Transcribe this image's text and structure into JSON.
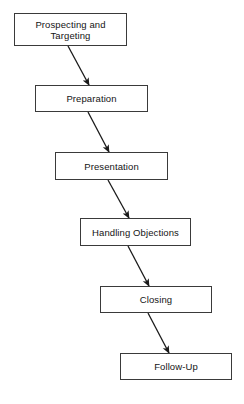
{
  "diagram": {
    "type": "flowchart",
    "orientation": "cascading-vertical",
    "background_color": "#ffffff",
    "box_border_color": "#3a3a3a",
    "arrow_color": "#1a1a1a",
    "text_color": "#141414",
    "nodes": [
      {
        "id": "prospecting-and-targeting",
        "label": "Prospecting and\nTargeting",
        "x": 14,
        "y": 13,
        "width": 113,
        "height": 33
      },
      {
        "id": "preparation",
        "label": "Preparation",
        "x": 35,
        "y": 85,
        "width": 113,
        "height": 27
      },
      {
        "id": "presentation",
        "label": "Presentation",
        "x": 55,
        "y": 152,
        "width": 113,
        "height": 28
      },
      {
        "id": "handling-objections",
        "label": "Handling Objections",
        "x": 80,
        "y": 218,
        "width": 111,
        "height": 28
      },
      {
        "id": "closing",
        "label": "Closing",
        "x": 100,
        "y": 286,
        "width": 112,
        "height": 27
      },
      {
        "id": "follow-up",
        "label": "Follow-Up",
        "x": 120,
        "y": 353,
        "width": 112,
        "height": 27
      }
    ],
    "edges": [
      {
        "id": "edge-1",
        "from": "prospecting-and-targeting",
        "to": "preparation",
        "x1": 68,
        "y1": 46,
        "x2": 89,
        "y2": 85
      },
      {
        "id": "edge-2",
        "from": "preparation",
        "to": "presentation",
        "x1": 88,
        "y1": 112,
        "x2": 109,
        "y2": 152
      },
      {
        "id": "edge-3",
        "from": "presentation",
        "to": "handling-objections",
        "x1": 108,
        "y1": 180,
        "x2": 129,
        "y2": 218
      },
      {
        "id": "edge-4",
        "from": "handling-objections",
        "to": "closing",
        "x1": 128,
        "y1": 246,
        "x2": 149,
        "y2": 286
      },
      {
        "id": "edge-5",
        "from": "closing",
        "to": "follow-up",
        "x1": 148,
        "y1": 313,
        "x2": 169,
        "y2": 353
      }
    ]
  }
}
